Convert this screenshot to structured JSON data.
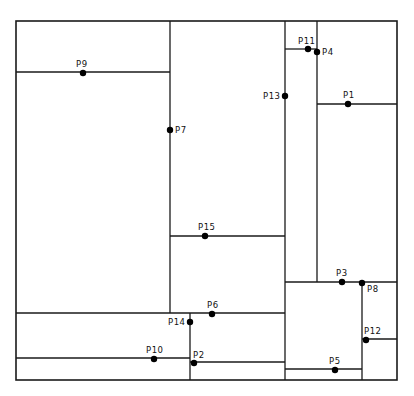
{
  "diagram": {
    "type": "spatial-partition",
    "frame": {
      "x1": 16,
      "y1": 21,
      "x2": 397,
      "y2": 380
    },
    "segments": [
      {
        "id": "v-P7",
        "x1": 170,
        "y1": 21,
        "x2": 170,
        "y2": 313
      },
      {
        "id": "h-P9",
        "x1": 16,
        "y1": 72,
        "x2": 170,
        "y2": 72
      },
      {
        "id": "v-P13",
        "x1": 285,
        "y1": 21,
        "x2": 285,
        "y2": 380
      },
      {
        "id": "h-P11",
        "x1": 285,
        "y1": 49,
        "x2": 317,
        "y2": 49
      },
      {
        "id": "v-P4",
        "x1": 317,
        "y1": 21,
        "x2": 317,
        "y2": 282
      },
      {
        "id": "h-P1",
        "x1": 317,
        "y1": 104,
        "x2": 397,
        "y2": 104
      },
      {
        "id": "h-P15",
        "x1": 170,
        "y1": 236,
        "x2": 285,
        "y2": 236
      },
      {
        "id": "h-P3",
        "x1": 285,
        "y1": 282,
        "x2": 397,
        "y2": 282
      },
      {
        "id": "v-P8",
        "x1": 362,
        "y1": 282,
        "x2": 362,
        "y2": 380
      },
      {
        "id": "h-P6",
        "x1": 16,
        "y1": 313,
        "x2": 285,
        "y2": 313
      },
      {
        "id": "v-P14",
        "x1": 190,
        "y1": 313,
        "x2": 190,
        "y2": 380
      },
      {
        "id": "h-P12",
        "x1": 362,
        "y1": 339,
        "x2": 397,
        "y2": 339
      },
      {
        "id": "h-P10",
        "x1": 16,
        "y1": 358,
        "x2": 190,
        "y2": 358
      },
      {
        "id": "h-P2",
        "x1": 190,
        "y1": 362,
        "x2": 285,
        "y2": 362
      },
      {
        "id": "h-P5",
        "x1": 285,
        "y1": 369,
        "x2": 362,
        "y2": 369
      }
    ],
    "points": [
      {
        "label": "P1",
        "x": 348,
        "y": 104,
        "lx": 343,
        "ly": 98
      },
      {
        "label": "P2",
        "x": 194,
        "y": 363,
        "lx": 193,
        "ly": 358
      },
      {
        "label": "P3",
        "x": 342,
        "y": 282,
        "lx": 336,
        "ly": 276
      },
      {
        "label": "P4",
        "x": 317,
        "y": 52,
        "lx": 322,
        "ly": 55
      },
      {
        "label": "P5",
        "x": 335,
        "y": 370,
        "lx": 329,
        "ly": 364
      },
      {
        "label": "P6",
        "x": 212,
        "y": 314,
        "lx": 207,
        "ly": 308
      },
      {
        "label": "P7",
        "x": 170,
        "y": 130,
        "lx": 175,
        "ly": 133
      },
      {
        "label": "P8",
        "x": 362,
        "y": 283,
        "lx": 367,
        "ly": 292
      },
      {
        "label": "P9",
        "x": 83,
        "y": 73,
        "lx": 76,
        "ly": 67
      },
      {
        "label": "P10",
        "x": 154,
        "y": 359,
        "lx": 146,
        "ly": 353
      },
      {
        "label": "P11",
        "x": 308,
        "y": 49,
        "lx": 298,
        "ly": 44
      },
      {
        "label": "P12",
        "x": 366,
        "y": 340,
        "lx": 364,
        "ly": 334
      },
      {
        "label": "P13",
        "x": 285,
        "y": 96,
        "lx": 263,
        "ly": 99
      },
      {
        "label": "P14",
        "x": 190,
        "y": 322,
        "lx": 168,
        "ly": 325
      },
      {
        "label": "P15",
        "x": 205,
        "y": 236,
        "lx": 198,
        "ly": 230
      }
    ]
  }
}
